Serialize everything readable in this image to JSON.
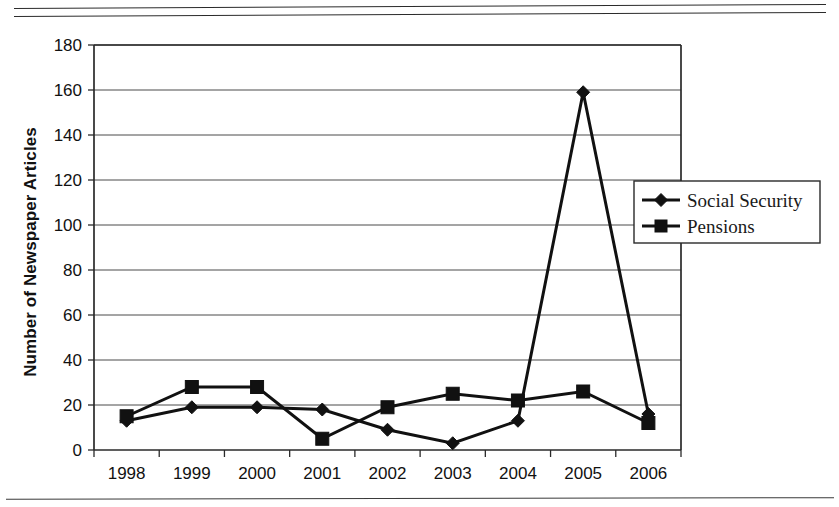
{
  "chart_data": {
    "type": "line",
    "title": "",
    "xlabel": "",
    "ylabel": "Number of Newspaper Articles",
    "categories": [
      "1998",
      "1999",
      "2000",
      "2001",
      "2002",
      "2003",
      "2004",
      "2005",
      "2006"
    ],
    "ylim": [
      0,
      180
    ],
    "ytick_step": 20,
    "yticks": [
      "0",
      "20",
      "40",
      "60",
      "80",
      "100",
      "120",
      "140",
      "160",
      "180"
    ],
    "grid": "horizontal",
    "legend_position": "right",
    "series": [
      {
        "name": "Social Security",
        "marker": "diamond",
        "color": "#111111",
        "values": [
          13,
          19,
          19,
          18,
          9,
          3,
          13,
          159,
          16
        ]
      },
      {
        "name": "Pensions",
        "marker": "square",
        "color": "#111111",
        "values": [
          15,
          28,
          28,
          5,
          19,
          25,
          22,
          26,
          12
        ]
      }
    ]
  },
  "axis": {
    "y_title": "Number of Newspaper Articles"
  },
  "legend": {
    "entries": [
      {
        "label": "Social Security",
        "marker": "diamond-marker"
      },
      {
        "label": "Pensions",
        "marker": "square-marker"
      }
    ]
  },
  "colors": {
    "ink": "#111111",
    "grid": "#4a4a4a",
    "frame": "#2a2a2a",
    "background": "#ffffff"
  }
}
